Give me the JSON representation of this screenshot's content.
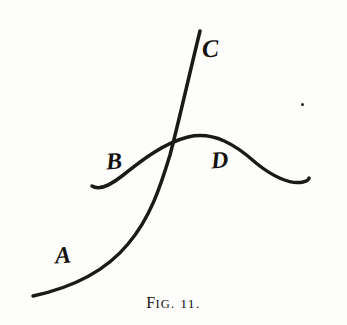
{
  "figure": {
    "caption_prefix_cap": "F",
    "caption_prefix_rest": "IG.",
    "caption_number": "11.",
    "caption_full": "FIG. 11.",
    "ink_color": "#1c1a18",
    "paper_color": "#fdfdfc",
    "labels": [
      {
        "id": "A",
        "text": "A",
        "x": 55,
        "y": 243,
        "describes": "lower-left branch of the rising S-curve"
      },
      {
        "id": "B",
        "text": "B",
        "x": 106,
        "y": 149,
        "describes": "left branch of the humped curve"
      },
      {
        "id": "C",
        "text": "C",
        "x": 202,
        "y": 36,
        "describes": "upper-right branch of the rising S-curve"
      },
      {
        "id": "D",
        "text": "D",
        "x": 211,
        "y": 148,
        "describes": "right branch of the humped curve"
      }
    ],
    "curves": [
      {
        "name": "rising-s-curve-ac",
        "from_label": "A",
        "to_label": "C",
        "stroke_width": 3.5,
        "path": "M 33 296 C 70 288 105 272 128 244 C 150 218 160 188 170 155 C 178 125 188 80 200 31"
      },
      {
        "name": "humped-curve-bd",
        "from_label": "B",
        "to_label": "D",
        "stroke_width": 3.5,
        "path": "M 92 186 C 98 190 108 187 122 176 C 142 160 164 143 188 137 C 214 131 236 145 256 163 C 272 176 290 185 303 182 C 307 181 309 180 309 178"
      }
    ],
    "intersection": {
      "x": 176,
      "y": 141
    },
    "speck": {
      "x": 301,
      "y": 103,
      "size": 3
    }
  }
}
